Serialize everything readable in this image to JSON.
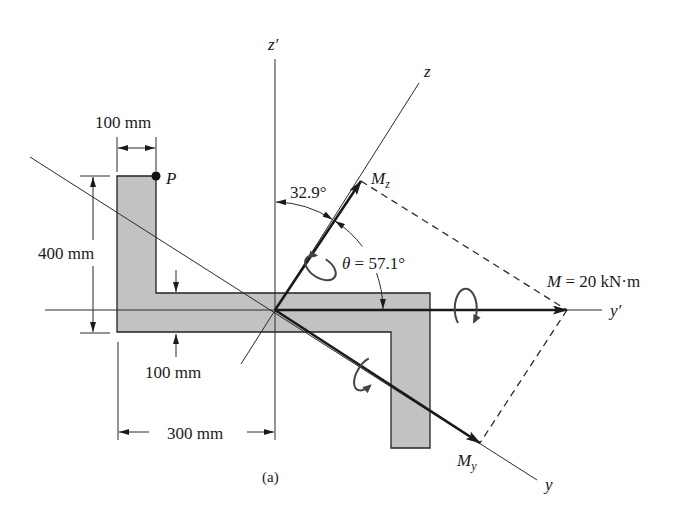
{
  "figure": {
    "caption": "(a)"
  },
  "colors": {
    "section_fill": "#c2c2c2",
    "ink": "#1a1a1a"
  },
  "axes": {
    "z_prime": "z′",
    "y_prime": "y′",
    "z": "z",
    "y": "y"
  },
  "point": {
    "label": "P"
  },
  "dimensions": {
    "top_flange_width": "100 mm",
    "overall_height": "400 mm",
    "flange_thickness": "100 mm",
    "web_to_centroid": "300 mm"
  },
  "moments": {
    "resultant": {
      "symbol": "M",
      "value": " = 20 kN·m"
    },
    "mz": {
      "symbol": "M",
      "subscript": "z"
    },
    "my": {
      "symbol": "M",
      "subscript": "y"
    }
  },
  "angles": {
    "z_axis_from_z_prime": "32.9°",
    "theta": {
      "symbol": "θ",
      "value": " = 57.1°"
    }
  }
}
